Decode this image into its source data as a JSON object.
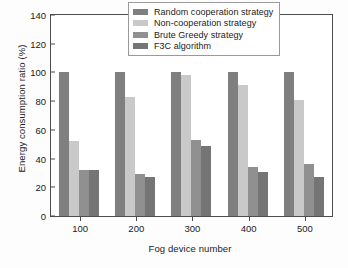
{
  "chart_data": {
    "type": "bar",
    "title": "",
    "xlabel": "Fog device number",
    "ylabel": "Energy consumption ratio (%)",
    "categories": [
      "100",
      "200",
      "300",
      "400",
      "500"
    ],
    "ylim": [
      0,
      140
    ],
    "yticks": [
      0,
      20,
      40,
      60,
      80,
      100,
      120,
      140
    ],
    "grid": false,
    "legend_position": "top-right",
    "series": [
      {
        "name": "Random cooperation strategy",
        "color": "#7f7f7f",
        "values": [
          100,
          100,
          100,
          100,
          100
        ]
      },
      {
        "name": "Non-cooperation strategy",
        "color": "#c9c9c9",
        "values": [
          52,
          83,
          98,
          91,
          81
        ]
      },
      {
        "name": "Brute Greedy strategy",
        "color": "#909090",
        "values": [
          32,
          29,
          53,
          34,
          36
        ]
      },
      {
        "name": "F3C algorithm",
        "color": "#757575",
        "values": [
          32,
          27.5,
          48.5,
          30.5,
          27
        ]
      }
    ]
  }
}
